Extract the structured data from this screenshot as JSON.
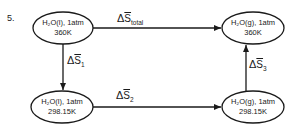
{
  "problem_number": "5.",
  "nodes": {
    "top_left": {
      "line1": "H₂O(l), 1atm",
      "line2": "360K"
    },
    "top_right": {
      "line1": "H₂O(g), 1atm",
      "line2": "360K"
    },
    "bottom_left": {
      "line1": "H₂O(l), 1atm",
      "line2": "298.15K"
    },
    "bottom_right": {
      "line1": "H₂O(g), 1atm",
      "line2": "298.15K"
    }
  },
  "edges": {
    "total": {
      "delta": "Δ",
      "symbol": "S",
      "sub": "total",
      "from": "top_left",
      "to": "top_right"
    },
    "s1": {
      "delta": "Δ",
      "symbol": "S",
      "sub": "1",
      "from": "top_left",
      "to": "bottom_left"
    },
    "s2": {
      "delta": "Δ",
      "symbol": "S",
      "sub": "2",
      "from": "bottom_left",
      "to": "bottom_right"
    },
    "s3": {
      "delta": "Δ",
      "symbol": "S",
      "sub": "3",
      "from": "bottom_right",
      "to": "top_right"
    }
  },
  "colors": {
    "ink": "#1a1a1a",
    "background": "#ffffff"
  }
}
